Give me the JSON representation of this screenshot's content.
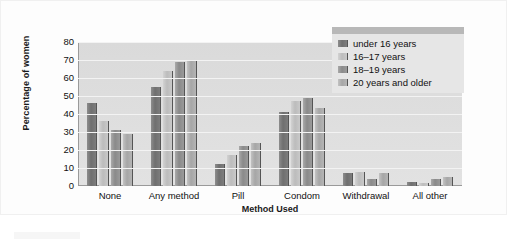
{
  "chart_data": {
    "type": "bar",
    "title": "",
    "xlabel": "Method Used",
    "ylabel": "Percentage of women",
    "categories": [
      "None",
      "Any method",
      "Pill",
      "Condom",
      "Withdrawal",
      "All other"
    ],
    "series": [
      {
        "name": "under 16 years",
        "values": [
          46,
          55,
          12,
          41,
          7,
          2
        ]
      },
      {
        "name": "16–17 years",
        "values": [
          36,
          64,
          17,
          47,
          8,
          1.5
        ]
      },
      {
        "name": "18–19 years",
        "values": [
          31,
          69,
          22,
          49,
          4,
          4
        ]
      },
      {
        "name": "20 years and older",
        "values": [
          29,
          69.5,
          24,
          43.5,
          7,
          5
        ]
      }
    ],
    "ylim": [
      0,
      80
    ],
    "yticks": [
      80,
      70,
      60,
      50,
      40,
      30,
      20,
      10,
      0
    ],
    "ytick_labels": [
      "80",
      "70",
      "60",
      "50",
      "40",
      "30",
      "20",
      "10",
      "0"
    ],
    "grid": true,
    "legend_position": "top-right",
    "series_colors": [
      "#6f6f6f",
      "#bcbcbc",
      "#8a8a8a",
      "#a6a6a6"
    ],
    "plot_background": "#dcdcdc",
    "gridline_color": "#f3f3f3",
    "axis_color": "#9a9a9a"
  }
}
